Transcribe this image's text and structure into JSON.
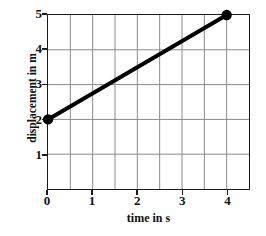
{
  "chart_data": {
    "type": "line",
    "title": "",
    "xlabel": "time in s",
    "ylabel": "displacement in m",
    "xlim": [
      0,
      4.5
    ],
    "ylim": [
      0,
      5
    ],
    "xticks": [
      0,
      1,
      2,
      3,
      4
    ],
    "yticks": [
      1,
      2,
      3,
      4,
      5
    ],
    "xtick_labels": [
      "0",
      "1",
      "2",
      "3",
      "4"
    ],
    "ytick_labels": [
      "1",
      "2",
      "3",
      "4",
      "5"
    ],
    "grid": true,
    "grid_x_step": 0.5,
    "grid_y_step": 1,
    "legend": null,
    "series": [
      {
        "name": "displacement",
        "x": [
          0,
          4
        ],
        "y": [
          2,
          5
        ],
        "markers": true,
        "marker_style": "filled-circle",
        "line_color": "#000000",
        "line_width": 4,
        "slope": 0.75,
        "intercept": 2
      }
    ],
    "colors": {
      "line": "#000000",
      "marker": "#000000",
      "grid": "#8a8a8a",
      "axis": "#1a1a1a",
      "background": "#ffffff"
    }
  },
  "axes": {
    "x_title": "time in s",
    "y_title": "displacement in m"
  }
}
